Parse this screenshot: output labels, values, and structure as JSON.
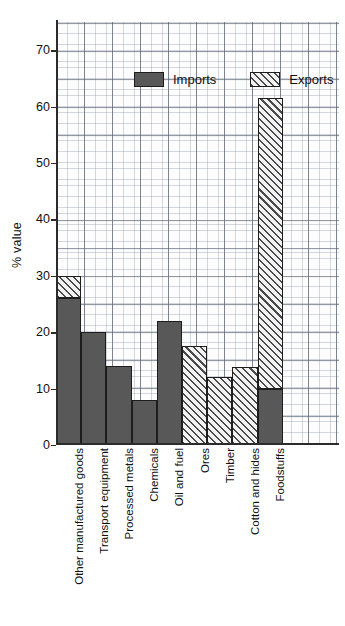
{
  "chart_data": {
    "type": "bar",
    "title": "",
    "subtitle": "",
    "xlabel": "",
    "ylabel": "% value",
    "ylim": [
      0,
      75
    ],
    "ytick_values": [
      0,
      10,
      20,
      30,
      40,
      50,
      60,
      70
    ],
    "ytick_labels": [
      "0",
      "10",
      "20",
      "30",
      "40",
      "50",
      "60",
      "70"
    ],
    "grid": true,
    "grid_style": "graph-paper",
    "legend_position": "top-inside",
    "stacked": true,
    "categories": [
      "Other manufactured goods",
      "Transport equipment",
      "Processed metals",
      "Chemicals",
      "Oil and fuel",
      "Ores",
      "Timber",
      "Cotton and hides",
      "Foodstuffs"
    ],
    "series": [
      {
        "name": "Imports",
        "color": "#585858",
        "fill": "solid",
        "values": [
          26,
          20,
          14,
          8,
          22,
          0,
          0,
          0,
          10
        ]
      },
      {
        "name": "Exports",
        "color": "#ebebeb",
        "fill": "diagonal-hatch",
        "values": [
          4,
          0,
          0,
          0,
          0,
          17.5,
          12,
          13.8,
          51.5
        ]
      }
    ],
    "bar_totals": [
      30,
      20,
      14,
      8,
      22,
      17.5,
      12,
      13.8,
      61.5
    ]
  },
  "legend": {
    "entries": [
      {
        "label": "Imports",
        "swatch": "solid-dark-gray"
      },
      {
        "label": "Exports",
        "swatch": "diagonal-hatch"
      }
    ]
  },
  "axes": {
    "y_title": "% value"
  }
}
